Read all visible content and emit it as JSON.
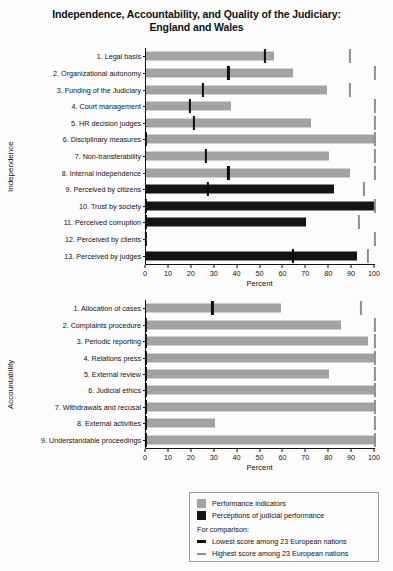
{
  "title": {
    "line1": "Independence, Accountability, and Quality of the Judiciary:",
    "line2": "England and Wales"
  },
  "axis": {
    "x_title": "Percent",
    "ticks": [
      0,
      10,
      20,
      30,
      40,
      50,
      60,
      70,
      80,
      90,
      100
    ],
    "xlim": [
      0,
      100
    ]
  },
  "sections": {
    "independence": {
      "label": "Independence"
    },
    "accountability": {
      "label": "Accountability"
    }
  },
  "legend": {
    "performance_label": "Performance indicators",
    "perception_label": "Perceptions of judicial performance",
    "comparison_header": "For comparison:",
    "lowest_label": "Lowest score among 23 European nations",
    "highest_label": "Highest score among 23 European nations"
  },
  "colors": {
    "performance": "#a3a3a3",
    "perception": "#141414",
    "lowest_marker": "#0d0d0d",
    "highest_marker": "#8d8d8d",
    "axis": "#111111",
    "background": "#fdfdfd"
  },
  "chart_data": {
    "type": "bar",
    "orientation": "horizontal",
    "title": "Independence, Accountability, and Quality of the Judiciary: England and Wales",
    "xlabel": "Percent",
    "ylabel": "",
    "xlim": [
      0,
      100
    ],
    "grid": false,
    "legend_position": "bottom-right",
    "panels": [
      {
        "name": "Independence",
        "categories": [
          "1. Legal basis",
          "2. Organizational autonomy",
          "3. Funding of the Judiciary",
          "4. Court management",
          "5. HR decision judges",
          "6. Disciplinary measures",
          "7. Non-transferability",
          "8. Internal independence",
          "9. Perceived by citizens",
          "10. Trust by society",
          "11. Perceived corruption",
          "12. Perceived by clients",
          "13. Perceived by judges"
        ],
        "series": [
          {
            "name": "Value",
            "values": [
              56,
              64,
              79,
              37,
              72,
              100,
              80,
              89,
              82,
              100,
              70,
              0,
              92
            ],
            "types": [
              "performance",
              "performance",
              "performance",
              "performance",
              "performance",
              "performance",
              "performance",
              "performance",
              "perception",
              "perception",
              "perception",
              "perception",
              "perception"
            ]
          },
          {
            "name": "Lowest score among 23 European nations",
            "values": [
              52,
              36,
              25,
              19,
              21,
              0,
              26,
              36,
              27,
              0,
              0,
              0,
              64
            ]
          },
          {
            "name": "Highest score among 23 European nations",
            "values": [
              89,
              100,
              89,
              100,
              100,
              100,
              100,
              100,
              95,
              100,
              93,
              100,
              97
            ]
          }
        ]
      },
      {
        "name": "Accountability",
        "categories": [
          "1. Allocation of cases",
          "2. Complaints procedure",
          "3. Periodic reporting",
          "4. Relations press",
          "5. External review",
          "6. Judicial ethics",
          "7. Withdrawals and recusal",
          "8. External activities",
          "9. Understandable proceedings"
        ],
        "series": [
          {
            "name": "Value",
            "values": [
              59,
              85,
              97,
              100,
              80,
              100,
              100,
              30,
              100
            ],
            "types": [
              "performance",
              "performance",
              "performance",
              "performance",
              "performance",
              "performance",
              "performance",
              "performance",
              "performance"
            ]
          },
          {
            "name": "Lowest score among 23 European nations",
            "values": [
              29,
              0,
              0,
              0,
              0,
              0,
              0,
              0,
              0
            ]
          },
          {
            "name": "Highest score among 23 European nations",
            "values": [
              94,
              100,
              100,
              100,
              100,
              100,
              100,
              100,
              100
            ]
          }
        ]
      }
    ]
  }
}
